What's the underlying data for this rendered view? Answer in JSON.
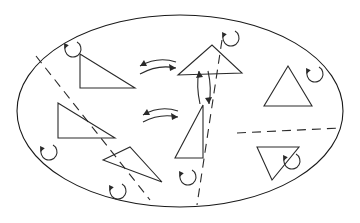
{
  "figure": {
    "title": "",
    "width": 360,
    "height": 223,
    "background_color": "#ffffff",
    "line_color": "#1a1a1a",
    "dash_color": "#2b2b2b",
    "shape_color": "#2a2a2a"
  },
  "boundary": {
    "name": "ellipse-boundary",
    "cx": 180,
    "cy": 111,
    "rx": 163,
    "ry": 96
  },
  "partitions": [
    {
      "name": "partition-left",
      "x1": 36,
      "y1": 56,
      "x2": 150,
      "y2": 200
    },
    {
      "name": "partition-center",
      "x1": 222,
      "y1": 40,
      "x2": 197,
      "y2": 205
    },
    {
      "name": "partition-right",
      "x1": 237,
      "y1": 133,
      "x2": 340,
      "y2": 128
    }
  ],
  "triangles": [
    {
      "name": "triangle-upper-left",
      "orientation": "right-angle",
      "points": "80,54 80,88 135,88"
    },
    {
      "name": "triangle-upper-center",
      "orientation": "oblique",
      "points": "178,75 212,45 242,73"
    },
    {
      "name": "triangle-left",
      "orientation": "right-angle",
      "points": "58,103 58,138 115,138"
    },
    {
      "name": "triangle-center",
      "orientation": "right-angle",
      "points": "203,105 203,158 175,158"
    },
    {
      "name": "triangle-bottom-center",
      "orientation": "oblique",
      "points": "103,160 130,147 162,182"
    },
    {
      "name": "triangle-right-upper",
      "orientation": "upward",
      "points": "288,66 264,106 312,106"
    },
    {
      "name": "triangle-right-lower",
      "orientation": "downward",
      "points": "257,147 299,147 272,180"
    }
  ],
  "rotation_markers": [
    {
      "name": "rotation-marker-top-left",
      "cx": 73,
      "cy": 49,
      "r": 8,
      "direction": "clockwise"
    },
    {
      "name": "rotation-marker-top-right",
      "cx": 231,
      "cy": 38,
      "r": 8,
      "direction": "clockwise"
    },
    {
      "name": "rotation-marker-left",
      "cx": 49,
      "cy": 152,
      "r": 8,
      "direction": "clockwise"
    },
    {
      "name": "rotation-marker-bottom-left",
      "cx": 118,
      "cy": 191,
      "r": 8,
      "direction": "clockwise"
    },
    {
      "name": "rotation-marker-bottom-center",
      "cx": 188,
      "cy": 177,
      "r": 8,
      "direction": "clockwise"
    },
    {
      "name": "rotation-marker-right",
      "cx": 315,
      "cy": 74,
      "r": 8,
      "direction": "clockwise"
    },
    {
      "name": "rotation-marker-bottom-right",
      "cx": 292,
      "cy": 161,
      "r": 8,
      "direction": "clockwise"
    }
  ],
  "exchange_arrows": [
    {
      "name": "exchange-arrows-top",
      "orientation": "horizontal",
      "arc_forward": "M 140,74 Q 158,64 176,68",
      "head_forward": "176,68 169,64 170,71",
      "arc_back": "M 176,62 Q 158,56 140,66",
      "head_back": "140,66 147,66 144,60"
    },
    {
      "name": "exchange-arrows-middle",
      "orientation": "horizontal",
      "arc_forward": "M 143,122 Q 160,113 178,117",
      "head_forward": "178,117 171,113 172,120",
      "arc_back": "M 178,111 Q 160,105 143,115",
      "head_back": "143,115 150,115 147,109"
    },
    {
      "name": "exchange-arrows-vertical",
      "orientation": "vertical",
      "arc_forward": "M 200,104 Q 196,86 199,71",
      "head_forward": "199,71 196,78 203,77",
      "arc_back": "M 208,71 Q 212,88 209,104",
      "head_back": "209,104 212,97 205,98"
    }
  ]
}
